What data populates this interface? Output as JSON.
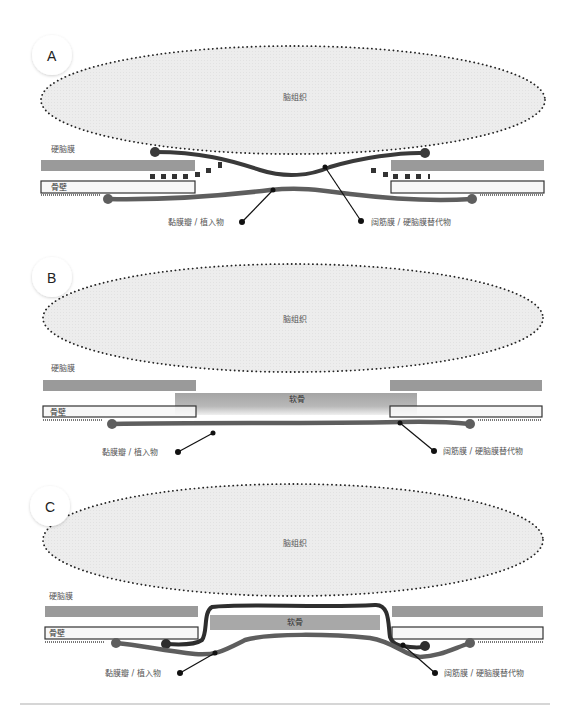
{
  "figure": {
    "panels": [
      {
        "letter": "A",
        "brain_label": "脑组织",
        "dura_label": "硬脑膜",
        "bone_label": "骨壁",
        "flap_label": "黏膜瓣 / 植入物",
        "fascia_label": "阔筋膜 / 硬脑膜替代物"
      },
      {
        "letter": "B",
        "brain_label": "脑组织",
        "dura_label": "硬脑膜",
        "bone_label": "骨壁",
        "cartilage_label": "软骨",
        "flap_label": "黏膜瓣 / 植入物",
        "fascia_label": "阔筋膜 / 硬脑膜替代物"
      },
      {
        "letter": "C",
        "brain_label": "脑组织",
        "dura_label": "硬脑膜",
        "bone_label": "骨壁",
        "cartilage_label": "软骨",
        "flap_label": "黏膜瓣 / 植入物",
        "fascia_label": "阔筋膜 / 硬脑膜替代物"
      }
    ],
    "colors": {
      "brain_fill": "#ececec",
      "brain_outline": "#222222",
      "dura": "#9a9a9a",
      "cartilage": "#a8a8a8",
      "bone_fill": "#f7f7f7",
      "bone_outline": "#333333",
      "fascia_line": "#3a3a3a",
      "flap_line": "#5e5e5e"
    }
  }
}
